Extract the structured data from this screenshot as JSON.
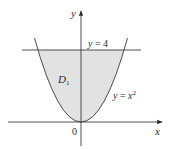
{
  "figure": {
    "type": "region-diagram",
    "region_label": "D",
    "region_subscript": "1",
    "curves": [
      {
        "name": "parabola",
        "equation_lhs": "y",
        "equation_rhs": "x",
        "exponent": "2",
        "label": "y = x²"
      },
      {
        "name": "horizontal-line",
        "label": "y = 4",
        "lhs": "y",
        "rhs": "4"
      }
    ],
    "axes": {
      "x_label": "x",
      "y_label": "y",
      "origin_label": "0"
    },
    "colors": {
      "region_fill": "#e2e2e2",
      "stroke": "#3a3a3a",
      "background": "#ffffff"
    }
  }
}
